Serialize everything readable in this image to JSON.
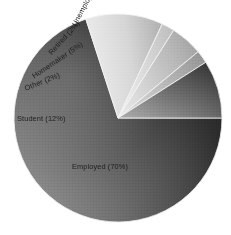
{
  "chart_data": {
    "type": "pie",
    "title": "",
    "subtitle": "",
    "xlabel": "",
    "ylabel": "",
    "legend_position": "none",
    "grid": false,
    "categories": [
      "Employed",
      "Student",
      "Other",
      "Homemaker",
      "Retired",
      "Unemployed"
    ],
    "values": [
      70,
      12,
      2,
      5,
      2,
      9
    ],
    "unit": "%",
    "labels": [
      "Employed (70%)",
      "Student (12%)",
      "Other (2%)",
      "Homemaker (5%)",
      "Retired (2%)",
      "Unemployed (9%)"
    ],
    "slices": [
      {
        "name": "Employed",
        "value": 70,
        "label": "Employed (70%)",
        "start_angle": 0,
        "end_angle": 252,
        "fill_light": "#8f8f8f",
        "fill_dark": "#151515",
        "label_x": 72,
        "label_y": 163,
        "label_rotation": 0,
        "label_on_dark": false
      },
      {
        "name": "Student",
        "value": 12,
        "label": "Student (12%)",
        "start_angle": 252,
        "end_angle": 295.2,
        "fill_light": "#e2e2e2",
        "fill_dark": "#b4b4b4",
        "label_x": 17,
        "label_y": 115,
        "label_rotation": 0,
        "label_on_dark": false
      },
      {
        "name": "Other",
        "value": 2,
        "label": "Other (2%)",
        "start_angle": 295.2,
        "end_angle": 302.4,
        "fill_light": "#e6e6e6",
        "fill_dark": "#c2c2c2",
        "label_x": 25,
        "label_y": 85,
        "label_rotation": -22,
        "label_on_dark": false
      },
      {
        "name": "Homemaker",
        "value": 5,
        "label": "Homemaker (5%)",
        "start_angle": 302.4,
        "end_angle": 320.4,
        "fill_light": "#dcdcdc",
        "fill_dark": "#a8a8a8",
        "label_x": 33,
        "label_y": 73,
        "label_rotation": -34,
        "label_on_dark": false
      },
      {
        "name": "Retired",
        "value": 2,
        "label": "Retired (2%)",
        "start_angle": 320.4,
        "end_angle": 327.6,
        "fill_light": "#d2d2d2",
        "fill_dark": "#9a9a9a",
        "label_x": 50,
        "label_y": 50,
        "label_rotation": -48,
        "label_on_dark": false
      },
      {
        "name": "Unemployed",
        "value": 9,
        "label": "Unemployed (9%)",
        "start_angle": 327.6,
        "end_angle": 360,
        "fill_light": "#8a8a8a",
        "fill_dark": "#3a3a3a",
        "label_x": 74,
        "label_y": 22,
        "label_rotation": -62,
        "label_on_dark": false
      }
    ],
    "geometry": {
      "center_x": 118,
      "center_y": 118,
      "radius": 104
    },
    "colors": {
      "background": "#ffffff",
      "separator": "#f2f2f2",
      "text": "#1d1d1d",
      "gradient_light": "#e4e4e4",
      "gradient_dark": "#141414"
    }
  }
}
